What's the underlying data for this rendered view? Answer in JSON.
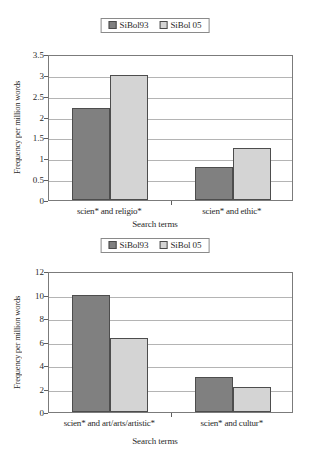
{
  "chart_data": [
    {
      "id": "top",
      "type": "bar",
      "title": "",
      "xlabel": "Search terms",
      "ylabel": "Frequency per million words",
      "categories": [
        "scien* and religio*",
        "scien* and ethic*"
      ],
      "series": [
        {
          "name": "SiBol93",
          "values": [
            2.2,
            0.8
          ],
          "color": "#808080"
        },
        {
          "name": "SiBol 05",
          "values": [
            3.0,
            1.25
          ],
          "color": "#d4d4d4"
        }
      ],
      "ylim": [
        0,
        3.5
      ],
      "yticks": [
        "0",
        "0.5",
        "1",
        "1.5",
        "2",
        "2.5",
        "3",
        "3.5"
      ],
      "ytick_values": [
        0,
        0.5,
        1,
        1.5,
        2,
        2.5,
        3,
        3.5
      ],
      "grid": true,
      "legend_position": "top-center"
    },
    {
      "id": "bottom",
      "type": "bar",
      "title": "",
      "xlabel": "Search terms",
      "ylabel": "Frequency per million words",
      "categories": [
        "scien* and art/arts/artistic*",
        "scien* and cultur*"
      ],
      "series": [
        {
          "name": "SiBol93",
          "values": [
            10.0,
            3.0
          ],
          "color": "#808080"
        },
        {
          "name": "SiBol 05",
          "values": [
            6.3,
            2.15
          ],
          "color": "#d4d4d4"
        }
      ],
      "ylim": [
        0,
        12
      ],
      "yticks": [
        "0",
        "2",
        "4",
        "6",
        "8",
        "10",
        "12"
      ],
      "ytick_values": [
        0,
        2,
        4,
        6,
        8,
        10,
        12
      ],
      "grid": true,
      "legend_position": "top-center"
    }
  ],
  "colors": {
    "series1": "#808080",
    "series2": "#d4d4d4",
    "axis": "#7b7b7b",
    "grid": "#b4b4b4",
    "text": "#2a2a2a"
  }
}
